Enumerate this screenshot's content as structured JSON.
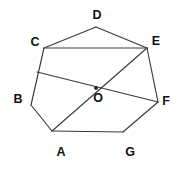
{
  "figure": {
    "kind": "geometry-diagram",
    "shape": "heptagon-with-diagonals",
    "canvas": {
      "width": 176,
      "height": 171,
      "background": "#ffffff"
    },
    "stroke_color": "#3a3a3a",
    "label_color": "#111111",
    "vertices": [
      {
        "id": "A",
        "label": "A",
        "x": 52,
        "y": 131,
        "label_x": 61,
        "label_y": 152
      },
      {
        "id": "B",
        "label": "B",
        "x": 31,
        "y": 105,
        "label_x": 18,
        "label_y": 99
      },
      {
        "id": "C",
        "label": "C",
        "x": 44,
        "y": 48,
        "label_x": 35,
        "label_y": 42
      },
      {
        "id": "D",
        "label": "D",
        "x": 96,
        "y": 27,
        "label_x": 97,
        "label_y": 15
      },
      {
        "id": "E",
        "label": "E",
        "x": 147,
        "y": 48,
        "label_x": 156,
        "label_y": 41
      },
      {
        "id": "F",
        "label": "F",
        "x": 158,
        "y": 102,
        "label_x": 166,
        "label_y": 101
      },
      {
        "id": "G",
        "label": "G",
        "x": 123,
        "y": 132,
        "label_x": 130,
        "label_y": 152
      },
      {
        "id": "O",
        "label": "O",
        "x": 96,
        "y": 88,
        "label_x": 98,
        "label_y": 98
      },
      {
        "id": "M",
        "label": "",
        "x": 37,
        "y": 72,
        "label_x": 0,
        "label_y": 0
      }
    ],
    "edges": [
      {
        "from": "A",
        "to": "B"
      },
      {
        "from": "B",
        "to": "C"
      },
      {
        "from": "C",
        "to": "D"
      },
      {
        "from": "D",
        "to": "E"
      },
      {
        "from": "E",
        "to": "F"
      },
      {
        "from": "F",
        "to": "G"
      },
      {
        "from": "G",
        "to": "A"
      }
    ],
    "diagonals": [
      {
        "from": "C",
        "to": "E",
        "label": "segment-CE"
      },
      {
        "from": "A",
        "to": "E",
        "label": "segment-AE"
      },
      {
        "from": "M",
        "to": "F",
        "label": "segment-MF"
      }
    ],
    "marked_points": [
      "O"
    ]
  }
}
